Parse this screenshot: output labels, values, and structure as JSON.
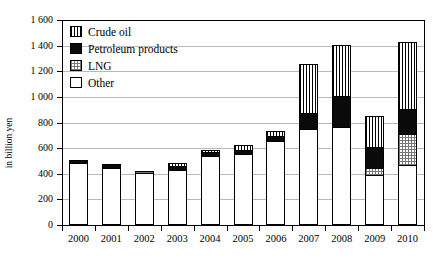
{
  "chart_data": {
    "type": "bar",
    "subtype": "stacked-vertical",
    "title": "",
    "xlabel": "",
    "ylabel": "in billion yen",
    "ylim": [
      0,
      1600
    ],
    "ytick_step": 200,
    "yticks": [
      "0",
      "200",
      "400",
      "600",
      "800",
      "1 000",
      "1 200",
      "1 400",
      "1 600"
    ],
    "grid": true,
    "grid_axis": "y",
    "legend_position": "top-left",
    "categories": [
      "2000",
      "2001",
      "2002",
      "2003",
      "2004",
      "2005",
      "2006",
      "2007",
      "2008",
      "2009",
      "2010"
    ],
    "series": [
      {
        "name": "Other",
        "pattern": "solid-white",
        "color": "#ffffff",
        "values": [
          480,
          440,
          395,
          425,
          530,
          545,
          650,
          740,
          760,
          380,
          460
        ]
      },
      {
        "name": "LNG",
        "pattern": "checkered-grey",
        "color": "#777777",
        "values": [
          0,
          0,
          20,
          0,
          0,
          0,
          0,
          0,
          0,
          60,
          240
        ]
      },
      {
        "name": "Petroleum products",
        "pattern": "solid-black",
        "color": "#0a0a0a",
        "values": [
          20,
          25,
          0,
          25,
          30,
          35,
          40,
          125,
          240,
          160,
          200
        ]
      },
      {
        "name": "Crude oil",
        "pattern": "vertical-stripes",
        "color": "#000000",
        "values": [
          0,
          0,
          0,
          25,
          20,
          35,
          35,
          385,
          400,
          240,
          520
        ]
      }
    ],
    "totals": [
      500,
      465,
      415,
      475,
      580,
      615,
      725,
      1250,
      1400,
      840,
      1420
    ],
    "annotations": []
  },
  "legend": {
    "items": [
      {
        "label": "Crude oil",
        "swatch": "crude"
      },
      {
        "label": "Petroleum products",
        "swatch": "petro"
      },
      {
        "label": "LNG",
        "swatch": "lng"
      },
      {
        "label": "Other",
        "swatch": "other"
      }
    ]
  }
}
